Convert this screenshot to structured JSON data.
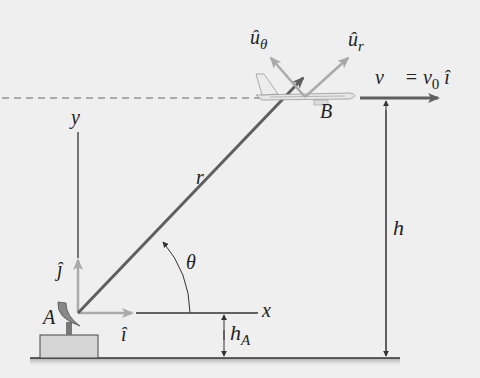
{
  "labels": {
    "u_theta": "û",
    "u_theta_sub": "θ",
    "u_r": "û",
    "u_r_sub": "r",
    "velocity": "v⃗ = v",
    "velocity_sub": "0",
    "velocity_unit": " î",
    "point_b": "B",
    "point_a": "A",
    "r_vec": "r⃗",
    "theta": "θ",
    "y_axis": "y",
    "x_axis": "x",
    "j_hat": "ĵ",
    "i_hat": "î",
    "h": "h",
    "h_a": "h",
    "h_a_sub": "A"
  },
  "colors": {
    "background": "#efefef",
    "dark_vector": "#5f5f5f",
    "light_vector": "#a9a9a9",
    "line": "#333333",
    "ground_block": "#d6d6d6"
  }
}
